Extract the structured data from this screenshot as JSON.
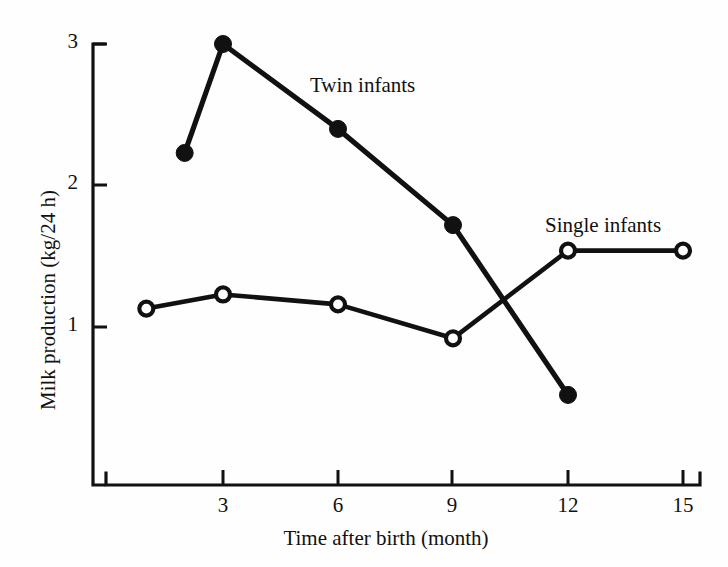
{
  "chart_data": {
    "type": "line",
    "title": "",
    "subtitle": "",
    "xlabel": "Time after birth (month)",
    "ylabel": "Milk production (kg/24 h)",
    "xlim": [
      0,
      15.9
    ],
    "ylim": [
      0,
      3.32
    ],
    "xticks": [
      3,
      6,
      9,
      12,
      15
    ],
    "xtick_labels": [
      "3",
      "6",
      "9",
      "12",
      "15"
    ],
    "yticks": [
      1,
      2,
      3
    ],
    "ytick_labels": [
      "1",
      "2",
      "3"
    ],
    "grid": false,
    "legend_position": "inline-annotations",
    "series": [
      {
        "name": "Twin infants",
        "marker": "filled-circle",
        "x": [
          2,
          3,
          6,
          9,
          12
        ],
        "values": [
          2.23,
          3.0,
          2.4,
          1.72,
          0.52
        ]
      },
      {
        "name": "Single infants",
        "marker": "open-circle",
        "x": [
          1,
          3,
          6,
          9,
          12,
          15
        ],
        "values": [
          1.13,
          1.23,
          1.16,
          0.92,
          1.54,
          1.54
        ]
      }
    ],
    "annotations": [
      {
        "text": "Twin infants",
        "x": 6.2,
        "y": 2.73
      },
      {
        "text": "Single infants",
        "x": 11.5,
        "y": 1.77
      }
    ]
  },
  "colors": {
    "ink": "#111111",
    "background": "#fefefe",
    "marker_open_fill": "#ffffff"
  }
}
